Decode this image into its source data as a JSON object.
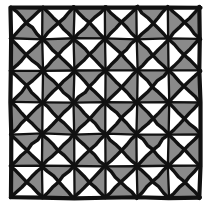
{
  "figure": {
    "title": "Square tiling with shaded triangular subdivisions"
  },
  "canvas": {
    "width": 211,
    "height": 212
  },
  "colors": {
    "background": "#ffffff",
    "ink": "#111111",
    "shaded_fill": "#8a8a8a",
    "unshaded_fill": "#ffffff"
  },
  "geometry": {
    "rows": 6,
    "cols": 6,
    "origin_x": 11,
    "origin_y": 7,
    "cell_width": 31.5,
    "cell_height": 31.8,
    "outer_frame_stroke": 4.2,
    "grid_line_stroke": 2.3,
    "diagonal_stroke": 3.4,
    "jitter_amplitude": 0.75
  },
  "legend": {
    "shaded_label": "shaded triangle",
    "unshaded_label": "unshaded triangle",
    "cell_label": "grid cell",
    "frame_label": "outer frame"
  },
  "chart_data": {
    "type": "heatmap",
    "title": "Square tiling with shaded triangular subdivisions",
    "xlabel": "",
    "ylabel": "",
    "grid": true,
    "legend_position": "none",
    "categories": [
      "c1",
      "c2",
      "c3",
      "c4",
      "c5",
      "c6"
    ],
    "row_labels": [
      "r1",
      "r2",
      "r3",
      "r4",
      "r5",
      "r6"
    ],
    "triangle_order": [
      "north",
      "east",
      "south",
      "west"
    ],
    "rule": "Cells with (row + col) even are shaded on north and south triangles; cells with (row + col) odd are shaded on east and west triangles.",
    "cells": [
      [
        {
          "row": 0,
          "col": 0,
          "north": 1,
          "east": 0,
          "south": 1,
          "west": 0
        },
        {
          "row": 0,
          "col": 1,
          "north": 0,
          "east": 1,
          "south": 0,
          "west": 1
        },
        {
          "row": 0,
          "col": 2,
          "north": 1,
          "east": 0,
          "south": 1,
          "west": 0
        },
        {
          "row": 0,
          "col": 3,
          "north": 0,
          "east": 1,
          "south": 0,
          "west": 1
        },
        {
          "row": 0,
          "col": 4,
          "north": 1,
          "east": 0,
          "south": 1,
          "west": 0
        },
        {
          "row": 0,
          "col": 5,
          "north": 0,
          "east": 1,
          "south": 0,
          "west": 1
        }
      ],
      [
        {
          "row": 1,
          "col": 0,
          "north": 0,
          "east": 1,
          "south": 0,
          "west": 1
        },
        {
          "row": 1,
          "col": 1,
          "north": 1,
          "east": 0,
          "south": 1,
          "west": 0
        },
        {
          "row": 1,
          "col": 2,
          "north": 0,
          "east": 1,
          "south": 0,
          "west": 1
        },
        {
          "row": 1,
          "col": 3,
          "north": 1,
          "east": 0,
          "south": 1,
          "west": 0
        },
        {
          "row": 1,
          "col": 4,
          "north": 0,
          "east": 1,
          "south": 0,
          "west": 1
        },
        {
          "row": 1,
          "col": 5,
          "north": 1,
          "east": 0,
          "south": 1,
          "west": 0
        }
      ],
      [
        {
          "row": 2,
          "col": 0,
          "north": 1,
          "east": 0,
          "south": 1,
          "west": 0
        },
        {
          "row": 2,
          "col": 1,
          "north": 0,
          "east": 1,
          "south": 0,
          "west": 1
        },
        {
          "row": 2,
          "col": 2,
          "north": 1,
          "east": 0,
          "south": 1,
          "west": 0
        },
        {
          "row": 2,
          "col": 3,
          "north": 0,
          "east": 1,
          "south": 0,
          "west": 1
        },
        {
          "row": 2,
          "col": 4,
          "north": 1,
          "east": 0,
          "south": 1,
          "west": 0
        },
        {
          "row": 2,
          "col": 5,
          "north": 0,
          "east": 1,
          "south": 0,
          "west": 1
        }
      ],
      [
        {
          "row": 3,
          "col": 0,
          "north": 0,
          "east": 1,
          "south": 0,
          "west": 1
        },
        {
          "row": 3,
          "col": 1,
          "north": 1,
          "east": 0,
          "south": 1,
          "west": 0
        },
        {
          "row": 3,
          "col": 2,
          "north": 0,
          "east": 1,
          "south": 0,
          "west": 1
        },
        {
          "row": 3,
          "col": 3,
          "north": 1,
          "east": 0,
          "south": 1,
          "west": 0
        },
        {
          "row": 3,
          "col": 4,
          "north": 0,
          "east": 1,
          "south": 0,
          "west": 1
        },
        {
          "row": 3,
          "col": 5,
          "north": 1,
          "east": 0,
          "south": 1,
          "west": 0
        }
      ],
      [
        {
          "row": 4,
          "col": 0,
          "north": 1,
          "east": 0,
          "south": 1,
          "west": 0
        },
        {
          "row": 4,
          "col": 1,
          "north": 0,
          "east": 1,
          "south": 0,
          "west": 1
        },
        {
          "row": 4,
          "col": 2,
          "north": 1,
          "east": 0,
          "south": 1,
          "west": 0
        },
        {
          "row": 4,
          "col": 3,
          "north": 0,
          "east": 1,
          "south": 0,
          "west": 1
        },
        {
          "row": 4,
          "col": 4,
          "north": 1,
          "east": 0,
          "south": 1,
          "west": 0
        },
        {
          "row": 4,
          "col": 5,
          "north": 0,
          "east": 1,
          "south": 0,
          "west": 1
        }
      ],
      [
        {
          "row": 5,
          "col": 0,
          "north": 0,
          "east": 1,
          "south": 0,
          "west": 1
        },
        {
          "row": 5,
          "col": 1,
          "north": 1,
          "east": 0,
          "south": 1,
          "west": 0
        },
        {
          "row": 5,
          "col": 2,
          "north": 0,
          "east": 1,
          "south": 0,
          "west": 1
        },
        {
          "row": 5,
          "col": 3,
          "north": 1,
          "east": 0,
          "south": 1,
          "west": 0
        },
        {
          "row": 5,
          "col": 4,
          "north": 0,
          "east": 1,
          "south": 0,
          "west": 1
        },
        {
          "row": 5,
          "col": 5,
          "north": 1,
          "east": 0,
          "south": 1,
          "west": 0
        }
      ]
    ]
  }
}
